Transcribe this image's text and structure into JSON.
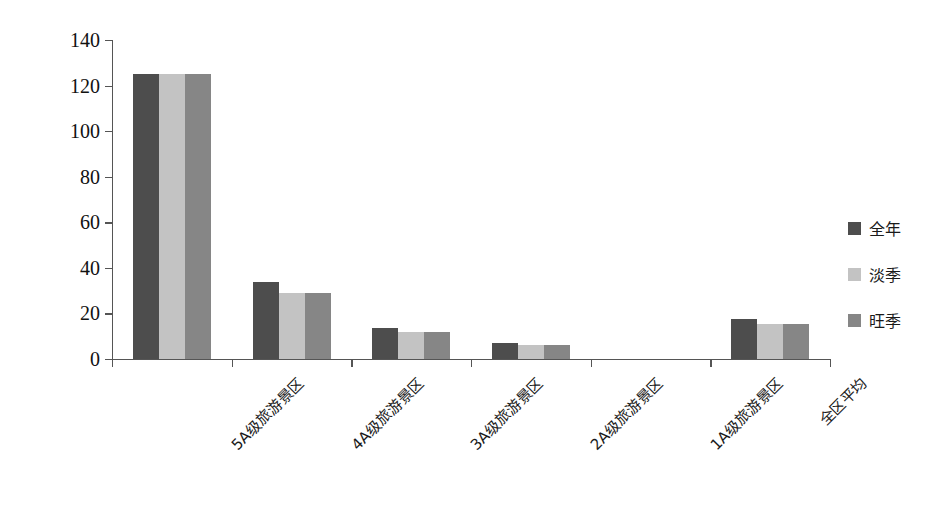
{
  "chart_data": {
    "type": "bar",
    "title": "",
    "xlabel": "",
    "ylabel": "平均门票价格（元/景区）",
    "ylim": [
      0,
      140
    ],
    "ytick_step": 20,
    "yticks": [
      0,
      20,
      40,
      60,
      80,
      100,
      120,
      140
    ],
    "grid": false,
    "legend_position": "right",
    "categories": [
      "5A级旅游景区",
      "4A级旅游景区",
      "3A级旅游景区",
      "2A级旅游景区",
      "1A级旅游景区",
      "全区平均"
    ],
    "series": [
      {
        "name": "全年",
        "color": "#4d4d4d",
        "values": [
          125,
          34,
          13.5,
          7,
          0,
          17.5
        ]
      },
      {
        "name": "淡季",
        "color": "#c3c3c3",
        "values": [
          125,
          29,
          12,
          6,
          0,
          15.5
        ]
      },
      {
        "name": "旺季",
        "color": "#868686",
        "values": [
          125,
          29,
          12,
          6,
          0,
          15.5
        ]
      }
    ]
  },
  "axis": {
    "y_title": "平均门票价格（元/景区）",
    "tick_labels": [
      "140",
      "120",
      "100",
      "80",
      "60",
      "40",
      "20",
      "0"
    ]
  },
  "legend": {
    "items": [
      {
        "label": "全年",
        "color": "#4d4d4d"
      },
      {
        "label": "淡季",
        "color": "#c3c3c3"
      },
      {
        "label": "旺季",
        "color": "#868686"
      }
    ]
  },
  "colors": {
    "series_1": "#4d4d4d",
    "series_2": "#c3c3c3",
    "series_3": "#868686",
    "axis": "#555555",
    "text": "#1a1a1a",
    "background": "#ffffff"
  }
}
